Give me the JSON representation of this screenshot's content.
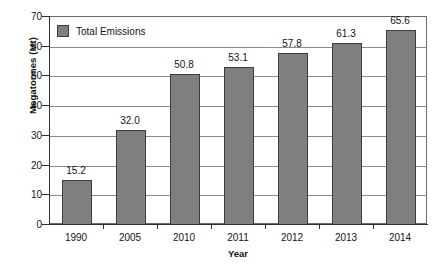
{
  "chart_data": {
    "type": "bar",
    "title": "",
    "xlabel": "Year",
    "ylabel": "Megatonnes (Mt)",
    "categories": [
      "1990",
      "2005",
      "2010",
      "2011",
      "2012",
      "2013",
      "2014"
    ],
    "values": [
      15.2,
      32.0,
      50.8,
      53.1,
      57.8,
      61.3,
      65.6
    ],
    "value_labels": [
      "15.2",
      "32.0",
      "50.8",
      "53.1",
      "57.8",
      "61.3",
      "65.6"
    ],
    "series": [
      {
        "name": "Total Emissions",
        "values": [
          15.2,
          32.0,
          50.8,
          53.1,
          57.8,
          61.3,
          65.6
        ],
        "color": "#7f7f7f"
      }
    ],
    "ylim": [
      0,
      70
    ],
    "ytick_labels": [
      "0",
      "10",
      "20",
      "30",
      "40",
      "50",
      "60",
      "70"
    ],
    "ytick_values": [
      0,
      10,
      20,
      30,
      40,
      50,
      60,
      70
    ],
    "grid": "horizontal",
    "legend": {
      "entries": [
        "Total Emissions"
      ],
      "position": "top-left-inside"
    }
  },
  "colors": {
    "bar_fill": "#7f7f7f",
    "bar_border": "#3d3d3d",
    "gridline": "#8a8a8a",
    "axis": "#2e2e2e",
    "background": "#ffffff"
  }
}
